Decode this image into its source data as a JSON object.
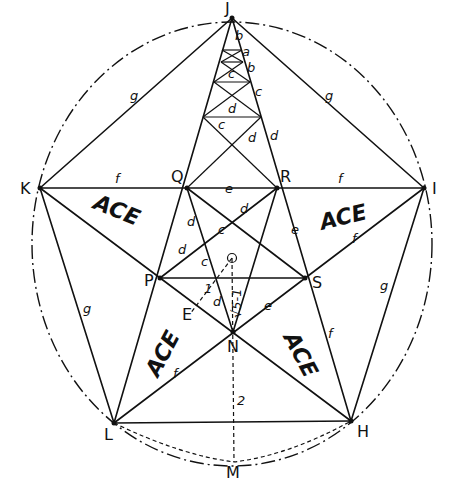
{
  "diagram": {
    "points": {
      "J": {
        "label": "J",
        "x": 232,
        "y": 18
      },
      "K": {
        "label": "K",
        "x": 40,
        "y": 188
      },
      "I": {
        "label": "I",
        "x": 424,
        "y": 188
      },
      "Q": {
        "label": "Q",
        "x": 187,
        "y": 188
      },
      "R": {
        "label": "R",
        "x": 277,
        "y": 188
      },
      "P": {
        "label": "P",
        "x": 160,
        "y": 278
      },
      "S": {
        "label": "S",
        "x": 305,
        "y": 278
      },
      "N": {
        "label": "N",
        "x": 233,
        "y": 332
      },
      "L": {
        "label": "L",
        "x": 114,
        "y": 423
      },
      "H": {
        "label": "H",
        "x": 351,
        "y": 421
      },
      "O": {
        "label": "O",
        "x": 232,
        "y": 258
      },
      "E": {
        "label": "E",
        "x": 190,
        "y": 314
      },
      "M": {
        "label": "M",
        "x": 234,
        "y": 462
      }
    },
    "segment_labels": {
      "a": "a",
      "b": "b",
      "c": "c",
      "d": "d",
      "e": "e",
      "f": "f",
      "g": "g",
      "one": "1",
      "two": "2",
      "sqrt5m1": "√5-1"
    },
    "region_labels": {
      "ace": "ACE"
    }
  }
}
